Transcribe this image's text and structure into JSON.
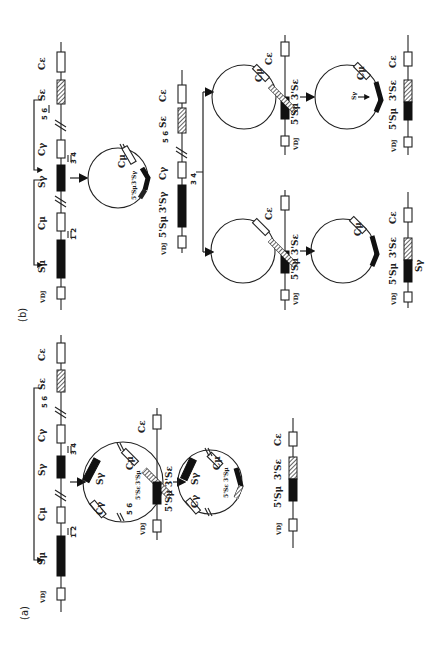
{
  "figure": {
    "orientation": "rotated-90-ccw",
    "panels": [
      {
        "id": "a",
        "label": "(a)",
        "germline": {
          "segments": [
            "VDJ",
            "Sμ",
            "Cμ",
            "Sγ",
            "Cγ",
            "Sε",
            "Cε"
          ],
          "primers": [
            "1 2",
            "3 4",
            "5 6"
          ]
        },
        "circle1": {
          "labels": [
            "Sγ",
            "Cγ",
            "Cμ",
            "5 6",
            "5'Sε",
            "3'Sμ"
          ]
        },
        "circle1_line": {
          "labels": [
            "VDJ",
            "5'Sμ",
            "3'Sε",
            "Cε"
          ]
        },
        "circle2": {
          "labels": [
            "Sγ",
            "Cγ",
            "Cμ",
            "5 6",
            "5'Sε",
            "3'Sμ"
          ]
        },
        "product": {
          "labels": [
            "VDJ",
            "5'Sμ",
            "3'Sε",
            "Cε"
          ]
        }
      },
      {
        "id": "b",
        "label": "(b)",
        "germline": {
          "segments": [
            "VDJ",
            "Sμ",
            "Cμ",
            "Sγ",
            "Cγ",
            "Sε",
            "Cε"
          ],
          "primers": [
            "1 2",
            "3 4",
            "5 6"
          ]
        },
        "circle1": {
          "labels": [
            "Cμ",
            "5'Sμ",
            "3'Sγ"
          ]
        },
        "intermediate": {
          "labels": [
            "VDJ",
            "5'Sμ",
            "3'Sγ",
            "Cγ",
            "3 4",
            "5 6",
            "Sε",
            "Cε"
          ]
        },
        "branch_left": {
          "circle": {
            "labels": [
              "Cμ",
              "5 6",
              "5'Sε",
              "3'Sγ"
            ]
          },
          "line": {
            "labels": [
              "VDJ",
              "5'Sμ",
              "3'Sε",
              "Cε"
            ]
          },
          "circle2": {
            "labels": [
              "Cμ",
              "5 6",
              "5'Sε",
              "3'Sγ"
            ]
          },
          "product": {
            "labels": [
              "VDJ",
              "5'Sμ",
              "3'Sε",
              "Sγ",
              "Cε"
            ]
          }
        },
        "branch_right": {
          "circle": {
            "labels": [
              "Cμ",
              "5 6",
              "5'Sε",
              "3'Sγ"
            ]
          },
          "line": {
            "labels": [
              "VDJ",
              "5'Sμ",
              "3'Sε",
              "Cε"
            ]
          },
          "circle2": {
            "labels": [
              "Cμ",
              "Sγ",
              "5 6",
              "5'Sε",
              "3'Sγ"
            ]
          },
          "product": {
            "labels": [
              "VDJ",
              "5'Sμ",
              "3'Sε",
              "Cε"
            ]
          }
        }
      }
    ]
  },
  "text": {
    "a": "(a)",
    "b": "(b)",
    "VDJ": "VDJ",
    "Smu": "Sμ",
    "Cmu": "Cμ",
    "Sg": "Sγ",
    "Cg": "Cγ",
    "Se": "Sε",
    "Ce": "Cε",
    "p12": "1 2",
    "p34": "3 4",
    "p56": "5 6",
    "s5Smu": "5'Sμ",
    "s3Se": "3'Sε",
    "s3Sg": "3'Sγ",
    "s5Se": "5'Sε",
    "s3Smu": "3'Sμ",
    "s5Smu_sm": "5'Sμ"
  }
}
